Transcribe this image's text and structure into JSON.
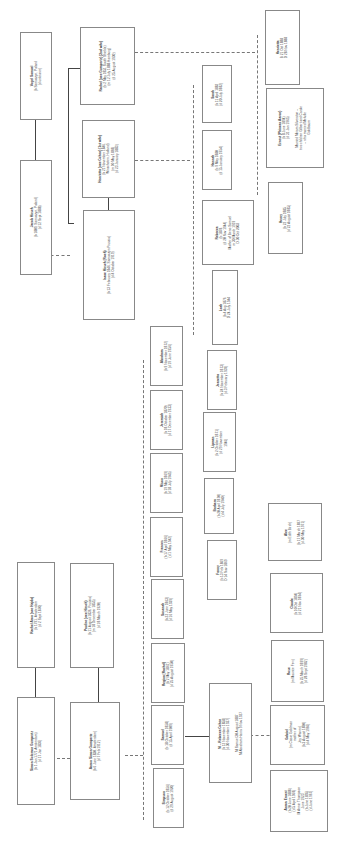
{
  "people": {
    "vogel": {
      "name": "Vogel Samuel",
      "lines": [
        "(b Samoczyn, Poland",
        "(d unknown)"
      ]
    },
    "jacob": {
      "name": "Jacob Hirsch",
      "lines": [
        "(b 1809, Samoczyn, Poland)",
        "(d 12 Sept 1888)"
      ]
    },
    "rachel_g": {
      "name": "Rachel (nee Gumpertz) (2nd wife)",
      "lines": [
        "(b 2 May 1851 South Shields)",
        "(m 12 July 1888 Hamburg)",
        "(d 25 August 1930)"
      ]
    },
    "henrietta_c": {
      "name": "Henrietta (nee Cohen) (1st wife)",
      "lines": [
        "(b 21 November 1846,",
        "Winschoten, Holland)",
        "(m 10 May 1868)",
        "(d 23 January 1883)"
      ]
    },
    "isaac": {
      "name": "Isaac Hirsch (Roeh)",
      "lines": [
        "(b 13 February 1846, Samoczyn Prussia)",
        "(d 4 October 1919)"
      ]
    },
    "henrietta": {
      "name": "Henrietta",
      "lines": [
        "B 21 Oct 1888",
        "D 28 Nov 1888"
      ]
    },
    "ernest": {
      "name": "Ernest (Phineas Aaron)",
      "lines": [
        "(b 8 June 1894)",
        "(d 31 Jan 1965)",
        "",
        "Married Miriam Silverston –",
        "two children Gilbert and Carole",
        "– who married Melville",
        "Goldbaum"
      ]
    },
    "sarah": {
      "name": "Sarah",
      "lines": [
        "(b 11 April 1882",
        "(d 20 July 1882)"
      ]
    },
    "hannah": {
      "name": "Hannah",
      "lines": [
        "(b 9 May 1880",
        "(d 15 January 1954)"
      ]
    },
    "rebecca_h": {
      "name": "Rebecca",
      "lines": [
        "(b 1878",
        "(d 20 Nov 1944)",
        "Mother of Beno Samuel",
        "m 30 March 1919",
        "D 30 Oct 2003"
      ]
    },
    "henry": {
      "name": "Henry",
      "lines": [
        "(b 22 July 1885",
        "(d 22 August 1885)"
      ]
    },
    "leah": {
      "name": "Leah",
      "lines": [
        "(b 4 Aug 1876",
        "D 24 July 1944"
      ]
    },
    "jeanetta": {
      "name": "Jeanetta",
      "lines": [
        "(b 24 November 1873)",
        "(d 3 February 1939)"
      ]
    },
    "lipman": {
      "name": "Lipman",
      "lines": [
        "(b 2 October 1871)",
        "(d 29 November",
        "1946)"
      ]
    },
    "barbara": {
      "name": "Barbara",
      "lines": [
        "(b 20 April 1870)",
        "(d 4 July 1940)"
      ]
    },
    "fanny": {
      "name": "Fanny",
      "lines": [
        "(b 13 Feb 1869",
        "D 14 Nov 1869"
      ]
    },
    "abraham": {
      "name": "Abraham",
      "lines": [
        "(b 9 November 1872)",
        "(d 19 June 1956)"
      ]
    },
    "jeremiah": {
      "name": "Jeremiah",
      "lines": [
        "(b 18 October 1870)",
        "(d 17 December 1933)"
      ]
    },
    "mison": {
      "name": "Mison",
      "lines": [
        "(b 19 May 1869)",
        "(d 18 July 1945)"
      ]
    },
    "frances": {
      "name": "Frances",
      "lines": [
        "(b 17 April 1866)",
        "(d 1 May 1942)"
      ]
    },
    "susanah": {
      "name": "Susanah",
      "lines": [
        "(b 22 June 1863)",
        "(d 16 May 1939)"
      ]
    },
    "regina": {
      "name": "Regina (Rachel)",
      "lines": [
        "(b 2 May 1861)",
        "(d 25 August 1950)"
      ]
    },
    "samuel": {
      "name": "Samuel",
      "lines": [
        "(b 18 October 1858)",
        "(d 15 April 1909)"
      ]
    },
    "simpson": {
      "name": "Simpson",
      "lines": [
        "(b 12 October 1856)",
        "(d 29 August 1920)"
      ]
    },
    "rachel_a": {
      "name": "Rachel Aron (nee Hajda)",
      "lines": [
        "(b 1791, Amsterdam",
        "(d 2 Sept 1870)"
      ]
    },
    "pauline": {
      "name": "Pauline (nee Hirsch)",
      "lines": [
        "(b 11 August 1836, Prussia)",
        "(m 18 December 1855)",
        "(d 18 March 1920)"
      ]
    },
    "simon": {
      "name": "Simon Solomon Gumpertz",
      "lines": [
        "(b 1 Jan 1771 Amsterdam)",
        "(d 17 Jan 1836)"
      ]
    },
    "aaron": {
      "name": "Aaron Simon Gumpertz",
      "lines": [
        "(b 6 June 1830, Amsterdam)",
        "(d 7 Feb 1912)"
      ]
    },
    "rebecca_c": {
      "name": "M – Rebecca Cohen",
      "lines": [
        "(b 12 November 1858)",
        "(d 30 November 1937)",
        "",
        "M Samuel 30 August 1887",
        "M Abraham Harris 9 Nov 1927"
      ]
    },
    "alec": {
      "name": "Alec",
      "lines": [
        "(m Edith Birch)",
        "",
        "(b 17 March 1897",
        "(d 30 May 1971)"
      ]
    },
    "claude": {
      "name": "Claude",
      "lines": [
        "(b 10 Oct 1894)",
        "(d 21 Nov 1894)"
      ]
    },
    "rose": {
      "name": "Rose",
      "lines": [
        "(m Maurice Few)",
        "",
        "(b 25 March 1899)",
        "(d 28 Sept 1982)"
      ]
    },
    "gabriel": {
      "name": "Gabriel",
      "lines": [
        "(m Cissie Goldman",
        "mother of",
        "Jey Warren)",
        "(b 3 August 1890)",
        "(d 4 May 1966)"
      ]
    },
    "aaron_e": {
      "name": "Aaron Ernest",
      "lines": [
        "(b 20 June 1888)",
        "(d 5 April 1968)",
        "M Annie Thompson",
        "June 1923",
        "(b June 1895)",
        "(d June 1967)"
      ]
    }
  }
}
